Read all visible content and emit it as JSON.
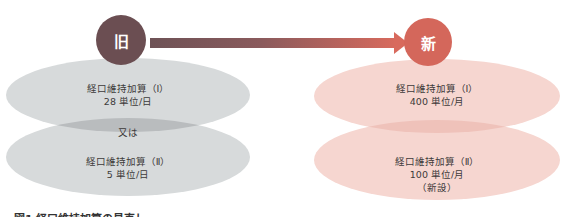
{
  "diagram": {
    "old": {
      "badge": "旧",
      "color": "#6b4e52",
      "ellipse_color": "#d7dadb",
      "overlap_color": "#b9bcbe",
      "top": {
        "name": "経口維持加算（Ⅰ）",
        "value": "28 単位/日"
      },
      "connector": "又は",
      "bottom": {
        "name": "経口維持加算（Ⅱ）",
        "value": "5 単位/日"
      }
    },
    "new": {
      "badge": "新",
      "color": "#d4675b",
      "ellipse_color": "#f6d6d0",
      "overlap_color": "#efc2ba",
      "top": {
        "name": "経口維持加算（Ⅰ）",
        "value": "400 単位/月"
      },
      "bottom": {
        "name": "経口維持加算（Ⅱ）",
        "value": "100 単位/月",
        "note": "（新設）"
      }
    },
    "arrow": {
      "from": "旧",
      "to": "新",
      "gradient": [
        "#6e5256",
        "#d86a5d"
      ]
    },
    "caption": "図1 経口維持加算の見直し"
  }
}
